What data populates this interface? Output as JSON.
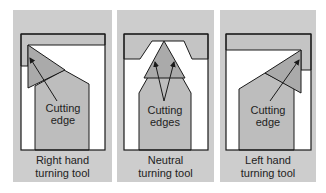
{
  "figure": {
    "colors": {
      "panel_bg": "#cdcdcd",
      "workpiece": "#c4c4c4",
      "insert": "#aaaaaa",
      "shank": "#bdbdbd",
      "outline": "#1a1a1a",
      "clearance": "#ffffff"
    },
    "panels": [
      {
        "id": "right-hand",
        "annotation_line1": "Cutting",
        "annotation_line2": "edge",
        "caption_line1": "Right hand",
        "caption_line2": "turning tool"
      },
      {
        "id": "neutral",
        "annotation_line1": "Cutting",
        "annotation_line2": "edges",
        "caption_line1": "Neutral",
        "caption_line2": "turning tool"
      },
      {
        "id": "left-hand",
        "annotation_line1": "Cutting",
        "annotation_line2": "edge",
        "caption_line1": "Left hand",
        "caption_line2": "turning tool"
      }
    ]
  }
}
